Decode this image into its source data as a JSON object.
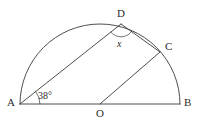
{
  "figure": {
    "type": "geometry-diagram",
    "width": 200,
    "height": 126,
    "background_color": "#ffffff",
    "stroke_color": "#3a3a3a",
    "text_color": "#2b2b2b",
    "stroke_width": 0.9
  },
  "circle": {
    "center_label": "O",
    "center_x": 100,
    "center_y": 104,
    "radius": 80,
    "arc_start_angle_deg": 0,
    "arc_end_angle_deg": 180
  },
  "points": [
    {
      "id": "A",
      "label": "A",
      "x": 20,
      "y": 104,
      "label_x": 7,
      "label_y": 97,
      "on": "diameter-left-end"
    },
    {
      "id": "B",
      "label": "B",
      "x": 180,
      "y": 104,
      "label_x": 184,
      "label_y": 97,
      "on": "diameter-right-end"
    },
    {
      "id": "O",
      "label": "O",
      "x": 100,
      "y": 104,
      "label_x": 96,
      "label_y": 108,
      "on": "center"
    },
    {
      "id": "C",
      "label": "C",
      "x": 160,
      "y": 52,
      "label_x": 165,
      "label_y": 41,
      "on": "arc"
    },
    {
      "id": "D",
      "label": "D",
      "x": 121,
      "y": 24,
      "label_x": 117,
      "label_y": 8,
      "on": "arc"
    }
  ],
  "segments": [
    {
      "id": "AB",
      "from": "A",
      "to": "B",
      "name": "diameter"
    },
    {
      "id": "AD",
      "from": "A",
      "to": "D",
      "name": "chord-ad"
    },
    {
      "id": "DC",
      "from": "D",
      "to": "C",
      "name": "chord-dc"
    },
    {
      "id": "OC",
      "from": "O",
      "to": "C",
      "name": "radius-oc"
    }
  ],
  "angles": [
    {
      "id": "angle-a",
      "label": "38°",
      "vertex": "A",
      "value": 38,
      "unit": "degrees",
      "arc_radius": 20,
      "label_x": 38,
      "label_y": 91,
      "italic": false
    },
    {
      "id": "angle-d",
      "label": "x",
      "vertex": "D",
      "value": null,
      "unit": "unknown",
      "arc_radius": 13,
      "label_x": 117,
      "label_y": 39,
      "italic": true
    }
  ]
}
